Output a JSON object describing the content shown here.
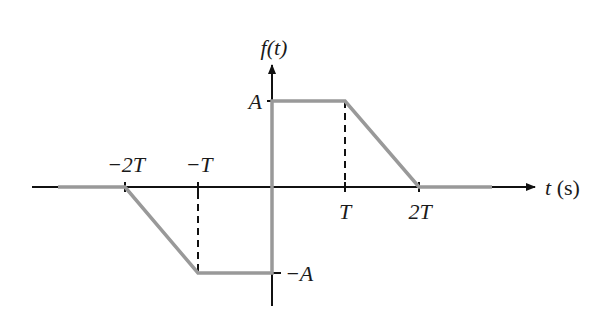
{
  "diagram": {
    "y_axis_label": "f(t)",
    "x_axis_label": "t (s)",
    "y_ticks": [
      {
        "label": "A",
        "value": "A"
      },
      {
        "label": "−A",
        "value": "-A"
      }
    ],
    "x_ticks": [
      {
        "label": "−2T",
        "value": "-2T"
      },
      {
        "label": "−T",
        "value": "-T"
      },
      {
        "label": "T",
        "value": "T"
      },
      {
        "label": "2T",
        "value": "2T"
      }
    ],
    "colors": {
      "axis": "#111111",
      "signal": "#999999",
      "dashed": "#111111"
    },
    "signal_points": [
      {
        "t": "-inf",
        "f": "0"
      },
      {
        "t": "-2T",
        "f": "0"
      },
      {
        "t": "-T",
        "f": "-A"
      },
      {
        "t": "0-",
        "f": "-A"
      },
      {
        "t": "0+",
        "f": "A"
      },
      {
        "t": "T",
        "f": "A"
      },
      {
        "t": "2T",
        "f": "0"
      },
      {
        "t": "+inf",
        "f": "0"
      }
    ]
  }
}
